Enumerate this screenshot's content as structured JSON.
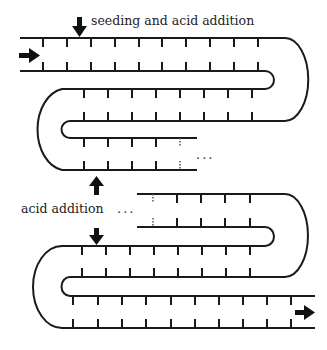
{
  "diagram": {
    "labels": {
      "top_injection": "seeding and acid addition",
      "middle_injection": "acid addition",
      "ellipsis_upper": "...",
      "ellipsis_lower": "..."
    },
    "arrows": {
      "inlet": "right-arrow",
      "outlet": "right-arrow",
      "top_injection": "down-arrow",
      "middle_out": "up-arrow",
      "middle_in": "down-arrow"
    },
    "segments": [
      {
        "name": "segment-1",
        "ticks": 10
      },
      {
        "name": "segment-2",
        "ticks": 8
      },
      {
        "name": "segment-3",
        "ticks": 4,
        "continues": true
      },
      {
        "name": "segment-4",
        "ticks": 4,
        "continues": true
      },
      {
        "name": "segment-5",
        "ticks": 8
      },
      {
        "name": "segment-6",
        "ticks": 10
      }
    ],
    "colors": {
      "line": "#1a1a1a",
      "background": "#ffffff"
    }
  }
}
